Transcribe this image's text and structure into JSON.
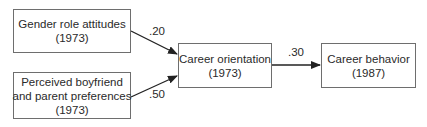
{
  "diagram": {
    "type": "path-diagram",
    "nodes": [
      {
        "id": "gender",
        "lines": [
          "Gender role attitudes",
          "(1973)"
        ]
      },
      {
        "id": "prefs",
        "lines": [
          "Perceived boyfriend",
          "and parent preferences",
          "(1973)"
        ]
      },
      {
        "id": "orientation",
        "lines": [
          "Career orientation",
          "(1973)"
        ]
      },
      {
        "id": "behavior",
        "lines": [
          "Career behavior",
          "(1987)"
        ]
      }
    ],
    "edges": [
      {
        "from": "gender",
        "to": "orientation",
        "coefficient": ".20"
      },
      {
        "from": "prefs",
        "to": "orientation",
        "coefficient": ".50"
      },
      {
        "from": "orientation",
        "to": "behavior",
        "coefficient": ".30"
      }
    ]
  }
}
